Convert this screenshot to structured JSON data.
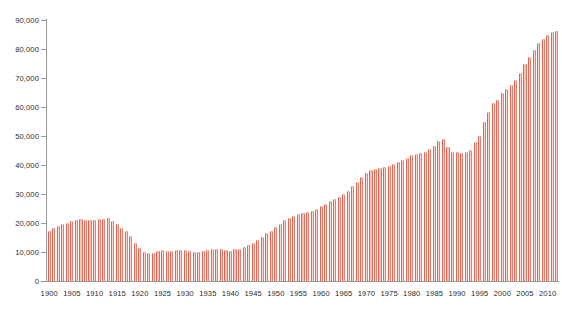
{
  "chart_data": {
    "type": "bar",
    "title": "",
    "subtitle": "",
    "xlabel": "",
    "ylabel": "",
    "grid": false,
    "legend": null,
    "ylim": [
      0,
      90000
    ],
    "ytick_step": 10000,
    "ytick_labels": [
      "0",
      "10,000",
      "20,000",
      "30,000",
      "40,000",
      "50,000",
      "60,000",
      "70,000",
      "80,000",
      "90,000"
    ],
    "ytick_values": [
      0,
      10000,
      20000,
      30000,
      40000,
      50000,
      60000,
      70000,
      80000,
      90000
    ],
    "xtick_labels": [
      "1900",
      "1905",
      "1910",
      "1915",
      "1920",
      "1925",
      "1930",
      "1935",
      "1940",
      "1945",
      "1950",
      "1955",
      "1960",
      "1965",
      "1970",
      "1975",
      "1980",
      "1985",
      "1990",
      "1995",
      "2000",
      "2005",
      "2010"
    ],
    "xtick_values": [
      1900,
      1905,
      1910,
      1915,
      1920,
      1925,
      1930,
      1935,
      1940,
      1945,
      1950,
      1955,
      1960,
      1965,
      1970,
      1975,
      1980,
      1985,
      1990,
      1995,
      2000,
      2005,
      2010
    ],
    "xlim": [
      1899.5,
      2012.5
    ],
    "bar_color": "#e2604c",
    "categories": [
      1900,
      1901,
      1902,
      1903,
      1904,
      1905,
      1906,
      1907,
      1908,
      1909,
      1910,
      1911,
      1912,
      1913,
      1914,
      1915,
      1916,
      1917,
      1918,
      1919,
      1920,
      1921,
      1922,
      1923,
      1924,
      1925,
      1926,
      1927,
      1928,
      1929,
      1930,
      1931,
      1932,
      1933,
      1934,
      1935,
      1936,
      1937,
      1938,
      1939,
      1940,
      1941,
      1942,
      1943,
      1944,
      1945,
      1946,
      1947,
      1948,
      1949,
      1950,
      1951,
      1952,
      1953,
      1954,
      1955,
      1956,
      1957,
      1958,
      1959,
      1960,
      1961,
      1962,
      1963,
      1964,
      1965,
      1966,
      1967,
      1968,
      1969,
      1970,
      1971,
      1972,
      1973,
      1974,
      1975,
      1976,
      1977,
      1978,
      1979,
      1980,
      1981,
      1982,
      1983,
      1984,
      1985,
      1986,
      1987,
      1988,
      1989,
      1990,
      1991,
      1992,
      1993,
      1994,
      1995,
      1996,
      1997,
      1998,
      1999,
      2000,
      2001,
      2002,
      2003,
      2004,
      2005,
      2006,
      2007,
      2008,
      2009,
      2010,
      2011,
      2012
    ],
    "values": [
      17200,
      18300,
      19100,
      19600,
      20100,
      20800,
      21000,
      21300,
      21100,
      20900,
      21100,
      21500,
      21400,
      21600,
      20700,
      19600,
      18400,
      17200,
      15400,
      13100,
      11300,
      10000,
      9500,
      9800,
      10500,
      10600,
      10300,
      10400,
      10600,
      10800,
      10700,
      10300,
      10100,
      10100,
      10400,
      10700,
      11000,
      11200,
      11100,
      10700,
      10300,
      10900,
      11200,
      11800,
      12400,
      13100,
      14100,
      15100,
      16500,
      17400,
      18500,
      19600,
      20900,
      21700,
      22400,
      23100,
      23300,
      23800,
      24100,
      24900,
      25800,
      26500,
      27500,
      28200,
      29100,
      30000,
      31200,
      32600,
      34200,
      35700,
      37100,
      38300,
      38600,
      39100,
      39400,
      39800,
      40300,
      41000,
      41800,
      42500,
      43400,
      43900,
      44200,
      44600,
      45600,
      46700,
      48300,
      48900,
      46200,
      44600,
      44400,
      44200,
      44500,
      45100,
      47800,
      50100,
      54700,
      58200,
      61300,
      62500,
      64900,
      66200,
      67600,
      69200,
      71800,
      74700,
      77400,
      79800,
      82100,
      83600,
      84900,
      85800,
      86300
    ]
  }
}
